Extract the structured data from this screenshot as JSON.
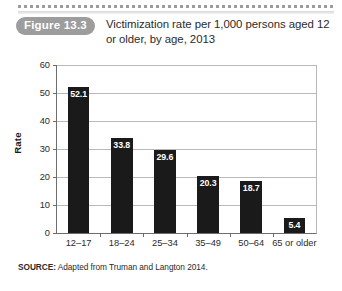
{
  "figure": {
    "badge": "Figure 13.3",
    "title": "Victimization rate per 1,000 persons aged 12 or older, by age, 2013"
  },
  "source": {
    "label": "SOURCE:",
    "text": "Adapted from Truman and Langton 2014."
  },
  "colors": {
    "bar": "#1a1a1a",
    "badge_bg": "#9d9d9d",
    "gridline": "#b9b9b9",
    "axis": "#6d6d6d",
    "value_label": "#ffffff"
  },
  "chart_data": {
    "type": "bar",
    "title": "Victimization rate per 1,000 persons aged 12 or older, by age, 2013",
    "xlabel": "",
    "ylabel": "Rate",
    "categories": [
      "12–17",
      "18–24",
      "25–34",
      "35–49",
      "50–64",
      "65 or older"
    ],
    "values": [
      52.1,
      33.8,
      29.6,
      20.3,
      18.7,
      5.4
    ],
    "value_labels": [
      "52.1",
      "33.8",
      "29.6",
      "20.3",
      "18.7",
      "5.4"
    ],
    "ylim": [
      0,
      60
    ],
    "yticks": [
      0,
      10,
      20,
      30,
      40,
      50,
      60
    ],
    "ytick_labels": [
      "0",
      "10",
      "20",
      "30",
      "40",
      "50",
      "60"
    ],
    "grid": true,
    "legend": false
  }
}
